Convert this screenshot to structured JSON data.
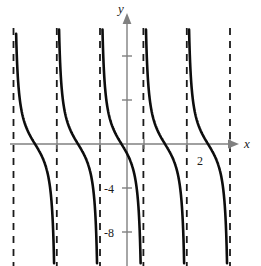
{
  "figure": {
    "width": 261,
    "height": 266,
    "background": "#ffffff"
  },
  "axes": {
    "x_axis_label": "x",
    "y_axis_label": "y",
    "axis_color": "#808080",
    "origin_px": {
      "x": 127,
      "y": 144
    },
    "pixels_per_unit_x": 43.0,
    "pixels_per_unit_y": 11.0,
    "x_axis_y_px": 144,
    "y_axis_x_px": 127,
    "x_axis_start_px": 10,
    "x_axis_end_px": 232,
    "y_axis_top_px": 18,
    "y_axis_bottom_px": 266
  },
  "ticks": {
    "x_labels": [
      {
        "text": "2",
        "x_px": 201,
        "y_px": 155,
        "value": 2
      }
    ],
    "y_labels": [
      {
        "text": "-4",
        "x_px": 106,
        "y_px": 184,
        "value": -4
      },
      {
        "text": "-8",
        "x_px": 106,
        "y_px": 228,
        "value": -8
      }
    ],
    "y_unlabeled_px": [
      56,
      100,
      188,
      232
    ],
    "x_unlabeled_px": [
      57,
      100,
      144,
      187,
      230
    ],
    "tick_half_len": 5
  },
  "chart_data": {
    "type": "line",
    "title": "",
    "xlabel": "x",
    "ylabel": "y",
    "grid": false,
    "legend": null,
    "curve_color": "#0d0d0d",
    "curve_width": 2.6,
    "asymptote_color": "#1a1a1a",
    "asymptote_dash": "7,6",
    "asymptote_width": 1.8,
    "period_px": 43.2,
    "asymptotes_px": [
      13.5,
      56.8,
      100.0,
      143.4,
      186.8,
      230.0
    ],
    "zero_crossings_px": [
      35,
      78,
      121.5,
      165,
      208
    ],
    "zero_crossings_units": [
      -2.14,
      -1.14,
      -0.13,
      0.88,
      1.88
    ],
    "branches": [
      {
        "name": "branch-1",
        "left_asymptote_px": 13.5,
        "right_asymptote_px": 56.8,
        "zero_px": 35,
        "top_y_px": 32,
        "bottom_y_px": 266,
        "visible_left_clip": 20
      },
      {
        "name": "branch-2",
        "left_asymptote_px": 56.8,
        "right_asymptote_px": 100.0,
        "zero_px": 78,
        "top_y_px": 30,
        "bottom_y_px": 266
      },
      {
        "name": "branch-3",
        "left_asymptote_px": 100.0,
        "right_asymptote_px": 143.4,
        "zero_px": 121.5,
        "top_y_px": 30,
        "bottom_y_px": 266
      },
      {
        "name": "branch-4",
        "left_asymptote_px": 143.4,
        "right_asymptote_px": 186.8,
        "zero_px": 165,
        "top_y_px": 30,
        "bottom_y_px": 266
      },
      {
        "name": "branch-5",
        "left_asymptote_px": 186.8,
        "right_asymptote_px": 230.0,
        "zero_px": 208,
        "top_y_px": 30,
        "bottom_y_px": 266
      }
    ],
    "y_tick_values": [
      8,
      4,
      -4,
      -8
    ],
    "x_tick_values": [
      2
    ],
    "ylim": [
      -11,
      11
    ],
    "xlim_px": [
      0,
      261
    ]
  }
}
